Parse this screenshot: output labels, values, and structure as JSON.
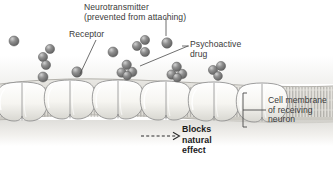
{
  "figure": {
    "background_color": "#ffffff",
    "text_color": "#3a3a3a",
    "bold_text_color": "#1b1b1b"
  },
  "labels": {
    "neurotransmitter": {
      "line1": "Neurotransmitter",
      "line2": "(prevented from attaching)"
    },
    "receptor": "Receptor",
    "drug": {
      "line1": "Psychoactive",
      "line2": "drug"
    },
    "membrane": {
      "line1": "Cell membrane",
      "line2": "of receiving",
      "line3": "neuron"
    },
    "blocks": {
      "line1": "Blocks",
      "line2": "natural",
      "line3": "effect"
    }
  },
  "graphic": {
    "membrane_color": "#f2f1ee",
    "receptor_color": "#f7f6f3",
    "receptor_outline": "#8d8d8d",
    "molecule_color": "#7b7b7b",
    "molecule_highlight": "#c9c9c9",
    "bilayer_stripe_color": "#9a9a9a",
    "leader_line_color": "#4a4a4a",
    "receptors": [
      {
        "cx": 22,
        "cy": 100
      },
      {
        "cx": 70,
        "cy": 98
      },
      {
        "cx": 118,
        "cy": 98
      },
      {
        "cx": 166,
        "cy": 99
      },
      {
        "cx": 214,
        "cy": 100
      },
      {
        "cx": 262,
        "cy": 101
      }
    ],
    "free_molecules": [
      {
        "cx": 14,
        "cy": 41,
        "r": 5.0
      },
      {
        "cx": 43,
        "cy": 57,
        "r": 4.6
      },
      {
        "cx": 50,
        "cy": 49,
        "r": 4.6
      },
      {
        "cx": 46,
        "cy": 65,
        "r": 4.6
      },
      {
        "cx": 43,
        "cy": 77,
        "r": 5.0
      },
      {
        "cx": 77,
        "cy": 72,
        "r": 5.2
      },
      {
        "cx": 113,
        "cy": 52,
        "r": 5.0
      },
      {
        "cx": 137,
        "cy": 46,
        "r": 4.6
      },
      {
        "cx": 145,
        "cy": 40,
        "r": 4.6
      },
      {
        "cx": 145,
        "cy": 52,
        "r": 4.6
      },
      {
        "cx": 167,
        "cy": 43,
        "r": 5.2
      }
    ],
    "bound_clusters": [
      {
        "cx": 127,
        "cy": 70
      },
      {
        "cx": 177,
        "cy": 72
      }
    ],
    "bracket": {
      "x": 243,
      "y_top": 94,
      "y_bottom": 126
    },
    "dashed_arrow": {
      "x1": 141,
      "x2": 178,
      "y": 136
    }
  }
}
